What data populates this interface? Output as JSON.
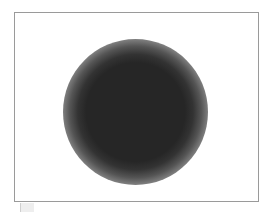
{
  "image": {
    "width": 275,
    "height": 212,
    "background_color": "#ffffff"
  },
  "frame": {
    "border_color": "#9a9a9a",
    "fill_color": "#ffffff"
  },
  "blob": {
    "shape": "circle",
    "core_color": "#262626",
    "edge": "soft radial fade to white"
  },
  "corner_tab": {
    "color": "#eeeeee"
  }
}
